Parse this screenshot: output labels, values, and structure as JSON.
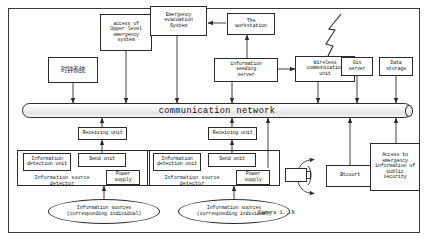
{
  "diagram": {
    "bus": {
      "label": "communication network"
    },
    "nodes": {
      "clock_system": "时钟系统",
      "upper_level": "access of\nUpper level\nemergency\nsystem",
      "emergency_evacuation": "Emergency\nevacuation\nSystem",
      "workstation": "The\nworkstation",
      "sending_server": "information\nseeding\nserver",
      "wireless_unit": "Wireless\ncommunication\nunit",
      "gis_server": "Gis\nserver",
      "data_storage": "Data\nstorage",
      "receiving_unit_left": "Receiving unit",
      "receiving_unit_right": "Receiving unit",
      "detection_unit_left": "Information\ndetection unit",
      "detection_unit_right": "Information\ndetection unit",
      "send_unit_left": "Send unit",
      "send_unit_right": "Send unit",
      "power_supply_left": "Power\nsupply",
      "power_supply_right": "Power\nsupply",
      "detector_caption_left": "Information source\ndetector",
      "detector_caption_right": "Information source\ndetector",
      "info_source_left": "Information sources\n(corresponding individual)",
      "info_source_right": "Information sources\n(corresponding individual)",
      "btcourt": "Btcourt",
      "public_security": "Access to\nemergency\ninformation of\npublic\nsecurity",
      "camera_label": "Camera 1...N"
    },
    "colors": {
      "stroke": "#2b2b2b",
      "text": "#1a1a1a",
      "background": "#ffffff",
      "bus_fill": "#e8e8e8"
    }
  }
}
